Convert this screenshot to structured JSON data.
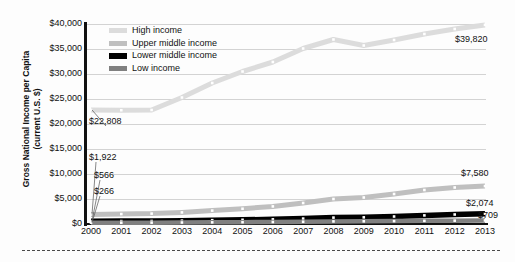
{
  "chart_data": {
    "type": "line",
    "title": "",
    "xlabel": "",
    "ylabel": "Gross National Income per Capita (current U.S. $)",
    "ylabel_line1": "Gross National Income per Capita",
    "ylabel_line2": "(current U.S. $)",
    "categories": [
      "2000",
      "2001",
      "2002",
      "2003",
      "2004",
      "2005",
      "2006",
      "2007",
      "2008",
      "2009",
      "2010",
      "2011",
      "2012",
      "2013"
    ],
    "ytick_labels": [
      "$40,000",
      "$35,000",
      "$30,000",
      "$25,000",
      "$20,000",
      "$15,000",
      "$10,000",
      "$5,000",
      "$0"
    ],
    "ytick_values": [
      40000,
      35000,
      30000,
      25000,
      20000,
      15000,
      10000,
      5000,
      0
    ],
    "ylim": [
      0,
      40000
    ],
    "grid": true,
    "legend_position": "top-left",
    "series": [
      {
        "name": "High income",
        "color": "#dcdcdc",
        "values": [
          22808,
          22750,
          22800,
          25300,
          28200,
          30500,
          32400,
          35100,
          36900,
          35700,
          36800,
          38000,
          39000,
          39820
        ],
        "start_label": "$22,808",
        "end_label": "$39,820"
      },
      {
        "name": "Upper middle income",
        "color": "#bfbfbf",
        "values": [
          1922,
          1990,
          2080,
          2320,
          2680,
          3050,
          3520,
          4200,
          5000,
          5300,
          6000,
          6800,
          7300,
          7580
        ],
        "start_label": "$1,922",
        "end_label": "$7,580"
      },
      {
        "name": "Lower middle income",
        "color": "#000000",
        "values": [
          566,
          580,
          600,
          670,
          760,
          840,
          930,
          1080,
          1280,
          1330,
          1500,
          1720,
          1900,
          2074
        ],
        "start_label": "$566",
        "end_label": "$2,074"
      },
      {
        "name": "Low income",
        "color": "#808080",
        "values": [
          266,
          265,
          275,
          300,
          330,
          360,
          400,
          450,
          520,
          540,
          580,
          630,
          670,
          709
        ],
        "start_label": "$266",
        "end_label": "$709"
      }
    ]
  },
  "legend": {
    "items": [
      {
        "label": "High income",
        "color": "#dcdcdc"
      },
      {
        "label": "Upper middle income",
        "color": "#bfbfbf"
      },
      {
        "label": "Lower middle income",
        "color": "#000000"
      },
      {
        "label": "Low income",
        "color": "#808080"
      }
    ]
  },
  "callouts": {
    "high_start": "$22,808",
    "upper_start": "$1,922",
    "lower_start": "$566",
    "low_start": "$266",
    "high_end": "$39,820",
    "upper_end": "$7,580",
    "lower_end": "$2,074",
    "low_end": "$709"
  }
}
